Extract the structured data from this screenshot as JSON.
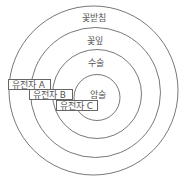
{
  "diagram": {
    "title": "",
    "rings": [
      {
        "id": "sepal",
        "label": "꽃받침",
        "cx": 93.5,
        "cy": 90.5,
        "r": 84.5,
        "label_x": 94,
        "label_y": 14
      },
      {
        "id": "petal",
        "label": "꽃잎",
        "cx": 95.5,
        "cy": 92.5,
        "r": 65,
        "label_x": 95,
        "label_y": 37
      },
      {
        "id": "stamen",
        "label": "수술",
        "cx": 97,
        "cy": 94,
        "r": 44.5,
        "label_x": 96,
        "label_y": 59
      },
      {
        "id": "carpel",
        "label": "암술",
        "cx": 97,
        "cy": 97.5,
        "r": 23,
        "label_x": 98,
        "label_y": 91
      }
    ],
    "genes": [
      {
        "id": "gene-a",
        "label": "유전자 A",
        "x": 8,
        "y": 79,
        "w": 43,
        "h": 11
      },
      {
        "id": "gene-b",
        "label": "유전자 B",
        "x": 29,
        "y": 89,
        "w": 44,
        "h": 11
      },
      {
        "id": "gene-c",
        "label": "유전자 C",
        "x": 56,
        "y": 100,
        "w": 42,
        "h": 11
      }
    ],
    "colors": {
      "stroke": "#555555",
      "text": "#555555",
      "background": "#ffffff"
    }
  }
}
